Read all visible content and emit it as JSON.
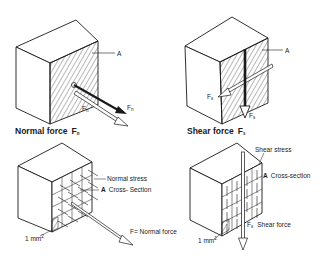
{
  "figure": {
    "panels": [
      {
        "id": "normal-force",
        "caption": "Normal force",
        "caption_symbol": "F",
        "caption_sub": "n",
        "labels": {
          "area": "A",
          "force1_symbol": "F",
          "force1_sub": "n",
          "force2_symbol": "F",
          "force2_sub": "n"
        }
      },
      {
        "id": "shear-force",
        "caption": "Shear force",
        "caption_symbol": "F",
        "caption_sub": "s",
        "labels": {
          "area": "A",
          "force1_symbol": "F",
          "force1_sub": "s",
          "force2_symbol": "F",
          "force2_sub": "s"
        }
      },
      {
        "id": "normal-stress",
        "labels": {
          "stress": "Normal stress",
          "area_letter": "A",
          "area": "Cross- Section",
          "force": "F= Normal force",
          "unit_area": "1 mm",
          "unit_sup": "2"
        }
      },
      {
        "id": "shear-stress",
        "labels": {
          "stress": "Shear stress",
          "area_letter": "A",
          "area": "Cross-section",
          "force_symbol": "F",
          "force_sub": "s",
          "force": "Shear force",
          "unit_area": "1 mm",
          "unit_sup": "2"
        }
      }
    ],
    "colors": {
      "ink": "#1a1a1a",
      "paper": "#ffffff"
    }
  }
}
